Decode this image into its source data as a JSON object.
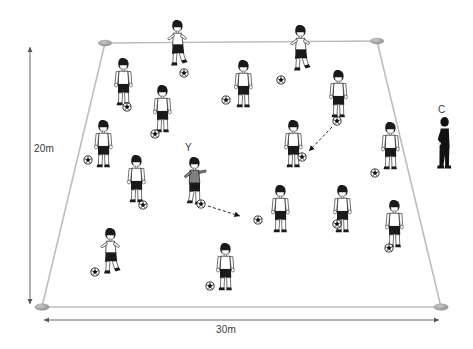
{
  "diagram": {
    "grid": {
      "shape": "trapezoid-perspective-rectangle",
      "width_label": "30m",
      "height_label": "20m",
      "line_color": "#b4b4b4",
      "cone_color": "#9a9a9a",
      "corners": [
        {
          "name": "top-left",
          "x": 105,
          "y": 43
        },
        {
          "name": "top-right",
          "x": 377,
          "y": 41
        },
        {
          "name": "bottom-right",
          "x": 441,
          "y": 307
        },
        {
          "name": "bottom-left",
          "x": 42,
          "y": 307
        }
      ]
    },
    "annotations": {
      "highlighted_player_label": "Y",
      "coach_label": "C"
    },
    "colors": {
      "shirt_white": "#ffffff",
      "shirt_grey": "#808080",
      "shorts_black": "#1a1a1a",
      "coach_black": "#111111",
      "outline": "#111111",
      "dimension_arrow": "#555555"
    },
    "players": [
      {
        "id": "p1",
        "x": 172,
        "y": 20,
        "pose": "running",
        "shirt": "white",
        "ball": {
          "x": 184,
          "y": 73
        }
      },
      {
        "id": "p2",
        "x": 295,
        "y": 25,
        "pose": "running",
        "shirt": "white",
        "ball": {
          "x": 281,
          "y": 80
        }
      },
      {
        "id": "p3",
        "x": 118,
        "y": 58,
        "pose": "standing",
        "shirt": "white",
        "ball": {
          "x": 127,
          "y": 107
        }
      },
      {
        "id": "p4",
        "x": 238,
        "y": 60,
        "pose": "standing",
        "shirt": "white",
        "ball": {
          "x": 226,
          "y": 100
        }
      },
      {
        "id": "p5",
        "x": 333,
        "y": 70,
        "pose": "standing",
        "shirt": "white",
        "ball": {
          "x": 337,
          "y": 121
        }
      },
      {
        "id": "p6",
        "x": 157,
        "y": 85,
        "pose": "standing",
        "shirt": "white",
        "ball": {
          "x": 155,
          "y": 134
        }
      },
      {
        "id": "p7",
        "x": 98,
        "y": 120,
        "pose": "standing",
        "shirt": "white",
        "ball": {
          "x": 88,
          "y": 160
        }
      },
      {
        "id": "p8",
        "x": 288,
        "y": 120,
        "pose": "standing",
        "shirt": "white",
        "ball": {
          "x": 302,
          "y": 157
        }
      },
      {
        "id": "p9",
        "x": 385,
        "y": 122,
        "pose": "standing",
        "shirt": "white",
        "ball": {
          "x": 375,
          "y": 173
        }
      },
      {
        "id": "p10",
        "x": 131,
        "y": 155,
        "pose": "standing",
        "shirt": "white",
        "ball": {
          "x": 143,
          "y": 205
        }
      },
      {
        "id": "p11",
        "x": 189,
        "y": 157,
        "pose": "passing",
        "shirt": "grey",
        "ball": {
          "x": 201,
          "y": 204
        },
        "label": "Y"
      },
      {
        "id": "p12",
        "x": 275,
        "y": 185,
        "pose": "standing",
        "shirt": "white",
        "ball": {
          "x": 258,
          "y": 220
        }
      },
      {
        "id": "p13",
        "x": 337,
        "y": 185,
        "pose": "standing",
        "shirt": "white",
        "ball": {
          "x": 337,
          "y": 224
        }
      },
      {
        "id": "p14",
        "x": 389,
        "y": 200,
        "pose": "standing",
        "shirt": "white",
        "ball": {
          "x": 389,
          "y": 248
        }
      },
      {
        "id": "p15",
        "x": 105,
        "y": 228,
        "pose": "running",
        "shirt": "white",
        "ball": {
          "x": 95,
          "y": 272
        }
      },
      {
        "id": "p16",
        "x": 220,
        "y": 243,
        "pose": "standing",
        "shirt": "white",
        "ball": {
          "x": 210,
          "y": 286
        }
      }
    ],
    "coach": {
      "id": "coach",
      "x": 440,
      "y": 117,
      "label": "C",
      "outfit": "black"
    },
    "arrows": [
      {
        "name": "pass-arrow-Y",
        "from": {
          "x": 208,
          "y": 206
        },
        "to": {
          "x": 241,
          "y": 216
        },
        "style": "dashed"
      },
      {
        "name": "pass-arrow-right",
        "from": {
          "x": 331,
          "y": 126
        },
        "to": {
          "x": 308,
          "y": 152
        },
        "style": "dashed"
      }
    ],
    "dimensions": [
      {
        "name": "height-dimension",
        "label": "20m",
        "from": {
          "x": 31,
          "y": 46
        },
        "to": {
          "x": 31,
          "y": 305
        }
      },
      {
        "name": "width-dimension",
        "label": "30m",
        "from": {
          "x": 42,
          "y": 320
        },
        "to": {
          "x": 441,
          "y": 320
        }
      }
    ]
  }
}
